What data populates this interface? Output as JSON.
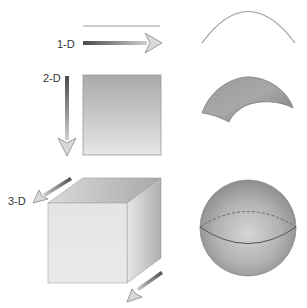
{
  "diagram": {
    "rows": [
      {
        "label": "1-D",
        "shape": "line",
        "curved_shape": "arc"
      },
      {
        "label": "2-D",
        "shape": "square",
        "curved_shape": "curved-surface"
      },
      {
        "label": "3-D",
        "shape": "cube",
        "curved_shape": "sphere"
      }
    ],
    "colors": {
      "line": "#b8b8b8",
      "arrow_shaft_dark": "#555555",
      "arrow_shaft_light": "#c8c8c8",
      "arrow_head": "#d8d8d8",
      "square_top": "#a8a8a8",
      "square_bottom": "#e4e4e4",
      "cube_front": "#e6e6e6",
      "cube_top": "#b4b4b4",
      "cube_side": "#c6c6c6",
      "sphere_light": "#d4d4d4",
      "sphere_dark": "#8c8c8c",
      "surface": "#999999",
      "outline": "#7a7a7a"
    }
  }
}
